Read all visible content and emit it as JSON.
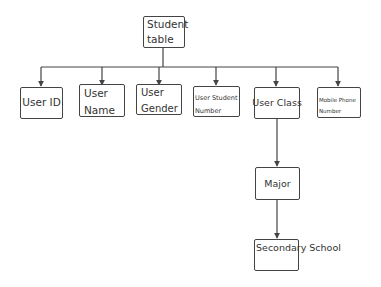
{
  "diagram": {
    "type": "hierarchy",
    "root": {
      "id": "student_table",
      "label": "Student\ntable"
    },
    "children": [
      {
        "id": "user_id",
        "label": "User ID"
      },
      {
        "id": "user_name",
        "label": "User\nName"
      },
      {
        "id": "user_gender",
        "label": "User\nGender"
      },
      {
        "id": "user_student_number",
        "label": "User Student\nNumber"
      },
      {
        "id": "user_class",
        "label": "User Class"
      },
      {
        "id": "mobile_phone_number",
        "label": "Mobile Phone\nNumber"
      }
    ],
    "chain": [
      {
        "id": "major",
        "label": "Major",
        "parent": "user_class"
      },
      {
        "id": "secondary_school",
        "label": "Secondary\nSchool",
        "parent": "major"
      }
    ],
    "edges": [
      {
        "from": "student_table",
        "to": "user_id"
      },
      {
        "from": "student_table",
        "to": "user_name"
      },
      {
        "from": "student_table",
        "to": "user_gender"
      },
      {
        "from": "student_table",
        "to": "user_student_number"
      },
      {
        "from": "student_table",
        "to": "user_class"
      },
      {
        "from": "student_table",
        "to": "mobile_phone_number"
      },
      {
        "from": "user_class",
        "to": "major"
      },
      {
        "from": "major",
        "to": "secondary_school"
      }
    ],
    "colors": {
      "line": "#444444",
      "box_border": "#444444",
      "text": "#333333",
      "background": "#ffffff"
    }
  }
}
